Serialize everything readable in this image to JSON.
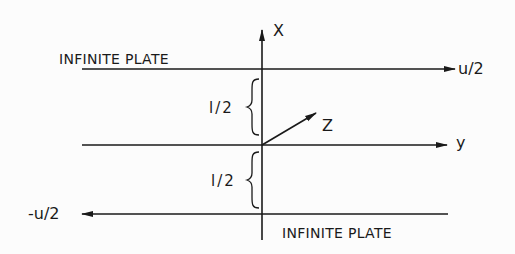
{
  "diagram": {
    "type": "coordinate-system / parallel plates (Couette flow)",
    "labels": {
      "top_plate": "INFINITE PLATE",
      "bottom_plate": "INFINITE PLATE",
      "top_velocity": "u/2",
      "bottom_velocity": "-u/2",
      "axis_x": "X",
      "axis_y": "y",
      "axis_z": "Z",
      "upper_gap": "l/2",
      "lower_gap": "l/2"
    },
    "colors": {
      "ink": "#1a1a1a",
      "background": "#fcfcfc"
    }
  }
}
